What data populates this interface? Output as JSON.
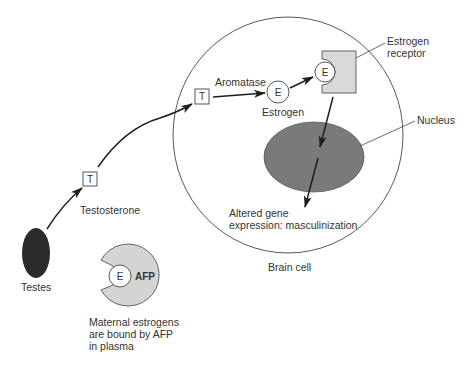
{
  "diagram": {
    "nodes": {
      "testes": {
        "label": "Testes",
        "fill": "#2b2b2b"
      },
      "testosterone_box_1": {
        "glyph": "T"
      },
      "testosterone_label": "Testosterone",
      "testosterone_box_2": {
        "glyph": "T"
      },
      "aromatase_label": "Aromatase",
      "estrogen_circle": {
        "glyph": "E"
      },
      "estrogen_label": "Estrogen",
      "receptor_bound_estrogen": {
        "glyph": "E"
      },
      "estrogen_receptor": {
        "label_line1": "Estrogen",
        "label_line2": "receptor",
        "fill": "#d9d9d9"
      },
      "nucleus": {
        "label": "Nucleus",
        "fill": "#7a7a7a"
      },
      "gene_expression": {
        "line1": "Altered gene",
        "line2": "expression: masculinization"
      },
      "brain_cell": {
        "label": "Brain cell"
      },
      "afp": {
        "glyph": "AFP",
        "fill": "#d4d4d4"
      },
      "afp_bound_estrogen": {
        "glyph": "E"
      },
      "maternal_note": {
        "line1": "Maternal estrogens",
        "line2": "are bound by AFP",
        "line3": "in plasma"
      }
    },
    "edges": [
      {
        "from": "testes",
        "to": "testosterone_box_1"
      },
      {
        "from": "testosterone_box_1",
        "to": "testosterone_box_2"
      },
      {
        "from": "testosterone_box_2",
        "to": "estrogen_circle",
        "label": "Aromatase"
      },
      {
        "from": "estrogen_circle",
        "to": "receptor_bound_estrogen"
      },
      {
        "from": "estrogen_receptor",
        "to": "nucleus"
      },
      {
        "from": "nucleus",
        "to": "gene_expression"
      }
    ]
  }
}
